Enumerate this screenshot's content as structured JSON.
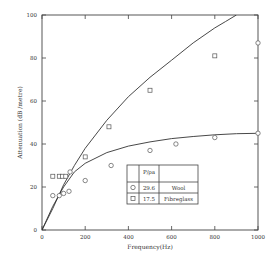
{
  "chart_data": {
    "type": "scatter",
    "title": "",
    "xlabel": "Frequency(Hz)",
    "ylabel": "Attenuation (dB /metre)",
    "xlim": [
      0,
      1000
    ],
    "ylim": [
      0,
      100
    ],
    "x_ticks": [
      0,
      200,
      400,
      600,
      800,
      1000
    ],
    "y_ticks": [
      0,
      20,
      40,
      60,
      80,
      100
    ],
    "grid": false,
    "legend": {
      "position": "lower-right-inside",
      "header": [
        "",
        "P/ρa",
        ""
      ],
      "rows": [
        {
          "marker": "circle",
          "value": "29.6",
          "label": "Wool"
        },
        {
          "marker": "square",
          "value": "17.5",
          "label": "Fibreglass"
        }
      ]
    },
    "series": [
      {
        "name": "Wool",
        "marker": "circle",
        "points": [
          [
            50,
            16
          ],
          [
            80,
            16
          ],
          [
            100,
            17
          ],
          [
            125,
            18
          ],
          [
            130,
            27
          ],
          [
            200,
            23
          ],
          [
            320,
            30
          ],
          [
            500,
            37
          ],
          [
            620,
            40
          ],
          [
            800,
            43
          ],
          [
            1000,
            45
          ],
          [
            1000,
            87
          ]
        ]
      },
      {
        "name": "Fibreglass",
        "marker": "square",
        "points": [
          [
            50,
            25
          ],
          [
            80,
            25
          ],
          [
            95,
            25
          ],
          [
            110,
            25
          ],
          [
            200,
            34
          ],
          [
            310,
            48
          ],
          [
            500,
            65
          ],
          [
            800,
            81
          ]
        ]
      }
    ],
    "curves": [
      {
        "name": "Wool fit",
        "points": [
          [
            0,
            0
          ],
          [
            50,
            11
          ],
          [
            100,
            20
          ],
          [
            150,
            27
          ],
          [
            200,
            31
          ],
          [
            300,
            36
          ],
          [
            400,
            39
          ],
          [
            500,
            41
          ],
          [
            600,
            42.5
          ],
          [
            700,
            43.5
          ],
          [
            800,
            44.3
          ],
          [
            900,
            44.8
          ],
          [
            1000,
            45
          ]
        ]
      },
      {
        "name": "Fibreglass fit",
        "points": [
          [
            0,
            0
          ],
          [
            50,
            10
          ],
          [
            100,
            21
          ],
          [
            150,
            30
          ],
          [
            200,
            38
          ],
          [
            300,
            51
          ],
          [
            400,
            62
          ],
          [
            500,
            71
          ],
          [
            600,
            79
          ],
          [
            700,
            87
          ],
          [
            800,
            94
          ],
          [
            850,
            97
          ],
          [
            900,
            100
          ]
        ]
      }
    ]
  }
}
